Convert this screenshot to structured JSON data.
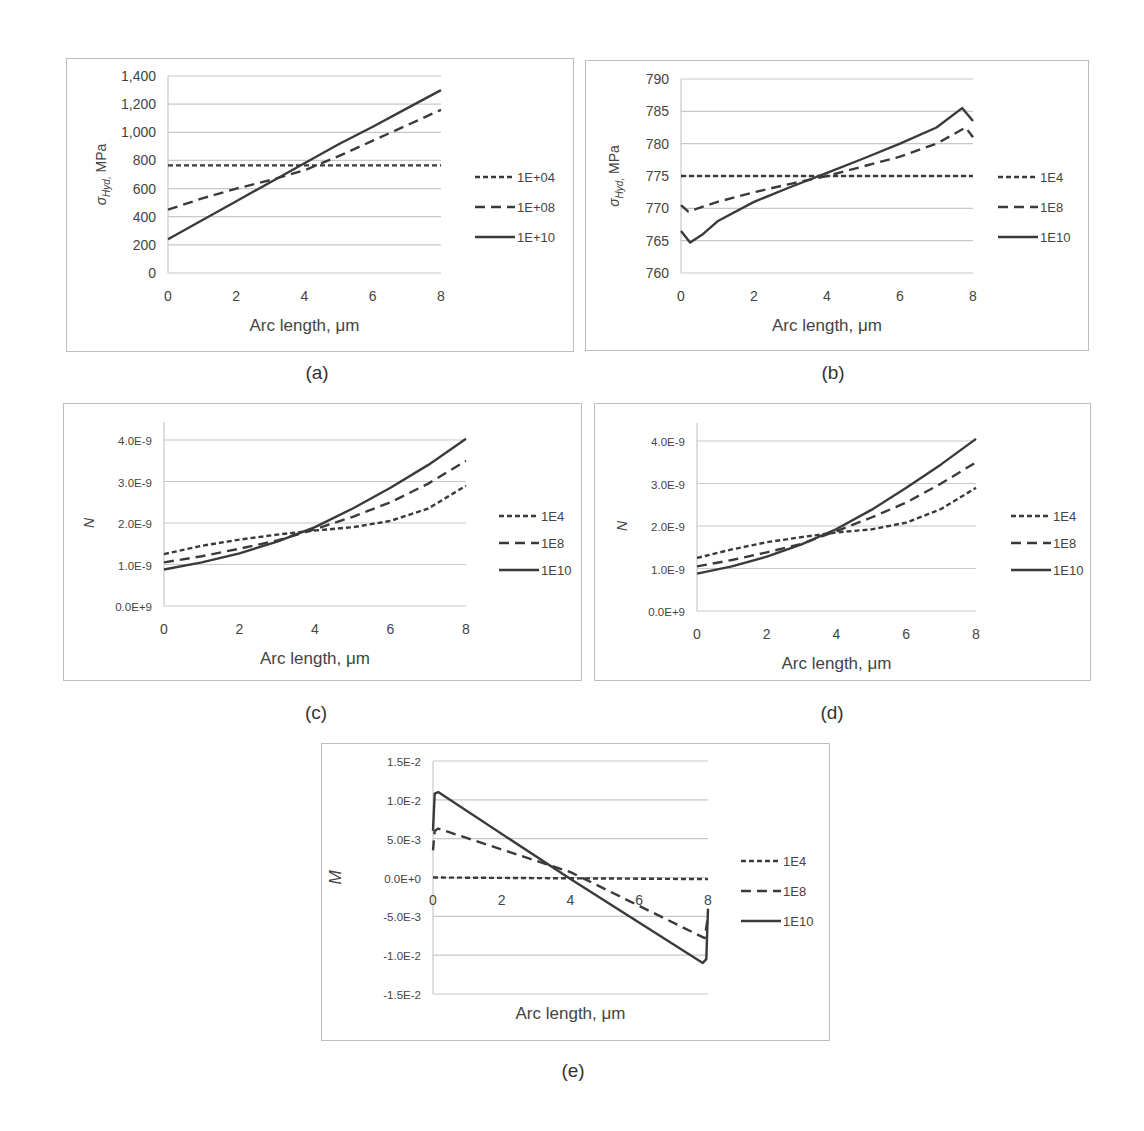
{
  "figure": {
    "captions": [
      "(a)",
      "(b)",
      "(c)",
      "(d)",
      "(e)"
    ]
  },
  "chart_data": [
    {
      "id": "a",
      "type": "line",
      "caption": "(a)",
      "xlabel": "Arc length, μm",
      "ylabel": "σHyd, MPa",
      "ylabel_main": "σ",
      "ylabel_sub": "Hyd,",
      "ylabel_unit": " MPa",
      "xlim": [
        0,
        8
      ],
      "ylim": [
        0,
        1400
      ],
      "xticks": [
        "0",
        "2",
        "4",
        "6",
        "8"
      ],
      "yticks": [
        "0",
        "200",
        "400",
        "600",
        "800",
        "1,000",
        "1,200",
        "1,400"
      ],
      "ytick_values": [
        0,
        200,
        400,
        600,
        800,
        1000,
        1200,
        1400
      ],
      "grid": true,
      "legend_position": "right",
      "x": [
        0,
        1,
        2,
        3,
        4,
        5,
        6,
        7,
        8
      ],
      "series": [
        {
          "name": "1E+04",
          "style": "short-dash",
          "values": [
            765,
            765,
            765,
            765,
            765,
            765,
            765,
            765,
            765
          ]
        },
        {
          "name": "1E+08",
          "style": "long-dash",
          "values": [
            450,
            530,
            600,
            660,
            730,
            830,
            940,
            1050,
            1160
          ]
        },
        {
          "name": "1E+10",
          "style": "solid",
          "values": [
            240,
            375,
            510,
            645,
            780,
            915,
            1040,
            1170,
            1300
          ]
        }
      ]
    },
    {
      "id": "b",
      "type": "line",
      "caption": "(b)",
      "xlabel": "Arc length, μm",
      "ylabel": "σHyd, MPa",
      "ylabel_main": "σ",
      "ylabel_sub": "Hyd,",
      "ylabel_unit": " MPa",
      "xlim": [
        0,
        8
      ],
      "ylim": [
        760,
        790
      ],
      "xticks": [
        "0",
        "2",
        "4",
        "6",
        "8"
      ],
      "yticks": [
        "760",
        "765",
        "770",
        "775",
        "780",
        "785",
        "790"
      ],
      "ytick_values": [
        760,
        765,
        770,
        775,
        780,
        785,
        790
      ],
      "grid": true,
      "legend_position": "right",
      "series": [
        {
          "name": "1E4",
          "style": "short-dash",
          "x": [
            0,
            8
          ],
          "values": [
            775,
            775
          ]
        },
        {
          "name": "1E8",
          "style": "long-dash",
          "x": [
            0,
            0.2,
            1,
            2,
            3,
            4,
            5,
            6,
            7,
            7.8,
            8
          ],
          "values": [
            770.5,
            769.5,
            771,
            772.5,
            773.8,
            775,
            776.5,
            778,
            780,
            782.5,
            781
          ]
        },
        {
          "name": "1E10",
          "style": "solid",
          "x": [
            0,
            0.25,
            0.6,
            1,
            2,
            3,
            4,
            5,
            6,
            7,
            7.7,
            8
          ],
          "values": [
            766.5,
            764.7,
            766,
            768,
            771,
            773.3,
            775.5,
            777.7,
            780,
            782.5,
            785.5,
            783.5
          ]
        }
      ]
    },
    {
      "id": "c",
      "type": "line",
      "caption": "(c)",
      "xlabel": "Arc length, μm",
      "ylabel": "N",
      "ylabel_main": "N",
      "ylabel_sub": "",
      "ylabel_unit": "",
      "xlim": [
        0,
        8
      ],
      "ylim": [
        0,
        4e-09
      ],
      "xticks": [
        "0",
        "2",
        "4",
        "6",
        "8"
      ],
      "yticks": [
        "0.0E+9",
        "1.0E-9",
        "2.0E-9",
        "3.0E-9",
        "4.0E-9"
      ],
      "ytick_values": [
        0,
        1e-09,
        2e-09,
        3e-09,
        4e-09
      ],
      "grid": true,
      "legend_position": "right",
      "x": [
        0,
        1,
        2,
        3,
        4,
        5,
        6,
        7,
        8
      ],
      "series": [
        {
          "name": "1E4",
          "style": "short-dash",
          "values": [
            1.25e-09,
            1.45e-09,
            1.6e-09,
            1.72e-09,
            1.82e-09,
            1.9e-09,
            2.05e-09,
            2.35e-09,
            2.9e-09
          ]
        },
        {
          "name": "1E8",
          "style": "long-dash",
          "values": [
            1.05e-09,
            1.2e-09,
            1.38e-09,
            1.58e-09,
            1.85e-09,
            2.15e-09,
            2.5e-09,
            2.95e-09,
            3.5e-09
          ]
        },
        {
          "name": "1E10",
          "style": "solid",
          "values": [
            8.8e-10,
            1.05e-09,
            1.27e-09,
            1.55e-09,
            1.9e-09,
            2.35e-09,
            2.85e-09,
            3.4e-09,
            4.03e-09
          ]
        }
      ]
    },
    {
      "id": "d",
      "type": "line",
      "caption": "(d)",
      "xlabel": "Arc length, μm",
      "ylabel": "N",
      "ylabel_main": "N",
      "ylabel_sub": "",
      "ylabel_unit": "",
      "xlim": [
        0,
        8
      ],
      "ylim": [
        0,
        4e-09
      ],
      "xticks": [
        "0",
        "2",
        "4",
        "6",
        "8"
      ],
      "yticks": [
        "0.0E+9",
        "1.0E-9",
        "2.0E-9",
        "3.0E-9",
        "4.0E-9"
      ],
      "ytick_values": [
        0,
        1e-09,
        2e-09,
        3e-09,
        4e-09
      ],
      "grid": true,
      "legend_position": "right",
      "x": [
        0,
        1,
        2,
        3,
        4,
        5,
        6,
        7,
        8
      ],
      "series": [
        {
          "name": "1E4",
          "style": "short-dash",
          "values": [
            1.25e-09,
            1.45e-09,
            1.62e-09,
            1.74e-09,
            1.85e-09,
            1.92e-09,
            2.08e-09,
            2.4e-09,
            2.9e-09
          ]
        },
        {
          "name": "1E8",
          "style": "long-dash",
          "values": [
            1.05e-09,
            1.2e-09,
            1.38e-09,
            1.58e-09,
            1.88e-09,
            2.2e-09,
            2.55e-09,
            3e-09,
            3.5e-09
          ]
        },
        {
          "name": "1E10",
          "style": "solid",
          "values": [
            8.8e-10,
            1.05e-09,
            1.28e-09,
            1.57e-09,
            1.93e-09,
            2.38e-09,
            2.9e-09,
            3.45e-09,
            4.05e-09
          ]
        }
      ]
    },
    {
      "id": "e",
      "type": "line",
      "caption": "(e)",
      "xlabel": "Arc length, μm",
      "ylabel": "M",
      "ylabel_main": "M",
      "ylabel_sub": "",
      "ylabel_unit": "",
      "xlim": [
        0,
        8
      ],
      "ylim": [
        -0.015,
        0.015
      ],
      "xticks": [
        "0",
        "2",
        "4",
        "6",
        "8"
      ],
      "yticks": [
        "-1.5E-2",
        "-1.0E-2",
        "-5.0E-3",
        "0.0E+0",
        "5.0E-3",
        "1.0E-2",
        "1.5E-2"
      ],
      "ytick_values": [
        -0.015,
        -0.01,
        -0.005,
        0,
        0.005,
        0.01,
        0.015
      ],
      "xaxis_at_zero": true,
      "grid": true,
      "legend_position": "right",
      "series": [
        {
          "name": "1E4",
          "style": "short-dash",
          "x": [
            0,
            8
          ],
          "values": [
            0.0,
            -0.0002
          ]
        },
        {
          "name": "1E8",
          "style": "long-dash",
          "x": [
            0,
            0.05,
            0.15,
            4,
            7.9,
            8
          ],
          "values": [
            0.0035,
            0.006,
            0.0063,
            0.0007,
            -0.0078,
            -0.005
          ]
        },
        {
          "name": "1E10",
          "style": "solid",
          "x": [
            0,
            0.05,
            0.15,
            4,
            7.85,
            7.95,
            8
          ],
          "values": [
            0.006,
            0.0108,
            0.011,
            -0.0002,
            -0.011,
            -0.0105,
            -0.004
          ]
        }
      ]
    }
  ]
}
